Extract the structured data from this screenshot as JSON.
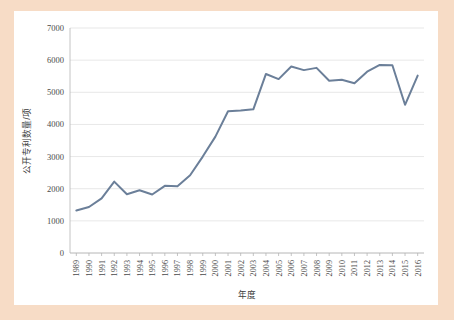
{
  "figure": {
    "background_color": "#f7dcc6",
    "card_color": "#ffffff"
  },
  "chart_data": {
    "type": "line",
    "title": "",
    "subtitle": "",
    "xlabel": "年度",
    "ylabel": "公开专利数量/项",
    "x": [
      1989,
      1990,
      1991,
      1992,
      1993,
      1994,
      1995,
      1996,
      1997,
      1998,
      1999,
      2000,
      2001,
      2002,
      2003,
      2004,
      2005,
      2006,
      2007,
      2008,
      2009,
      2010,
      2011,
      2012,
      2013,
      2014,
      2015,
      2016
    ],
    "categories": [
      "1989",
      "1990",
      "1991",
      "1992",
      "1993",
      "1994",
      "1995",
      "1996",
      "1997",
      "1998",
      "1999",
      "2000",
      "2001",
      "2002",
      "2003",
      "2004",
      "2005",
      "2006",
      "2007",
      "2008",
      "2009",
      "2010",
      "2011",
      "2012",
      "2013",
      "2014",
      "2015",
      "2016"
    ],
    "values": [
      1320,
      1430,
      1700,
      2220,
      1830,
      1950,
      1820,
      2090,
      2080,
      2420,
      3000,
      3620,
      4410,
      4430,
      4470,
      5570,
      5410,
      5800,
      5690,
      5760,
      5360,
      5390,
      5280,
      5640,
      5850,
      5840,
      4610,
      5520
    ],
    "series": [
      {
        "name": "公开专利数量",
        "color": "#6b7f99",
        "values": [
          1320,
          1430,
          1700,
          2220,
          1830,
          1950,
          1820,
          2090,
          2080,
          2420,
          3000,
          3620,
          4410,
          4430,
          4470,
          5570,
          5410,
          5800,
          5690,
          5760,
          5360,
          5390,
          5280,
          5640,
          5850,
          5840,
          4610,
          5520
        ]
      }
    ],
    "ylim": [
      0,
      7000
    ],
    "yticks": [
      0,
      1000,
      2000,
      3000,
      4000,
      5000,
      6000,
      7000
    ],
    "ytick_labels": [
      "0",
      "1000",
      "2000",
      "3000",
      "4000",
      "5000",
      "6000",
      "7000"
    ],
    "grid": true,
    "grid_axis": "y",
    "legend": false,
    "legend_position": "none",
    "line_color": "#6b7f99",
    "gridline_color": "#dcdcdc",
    "axis_color": "#b5b5b5",
    "markers": false
  }
}
